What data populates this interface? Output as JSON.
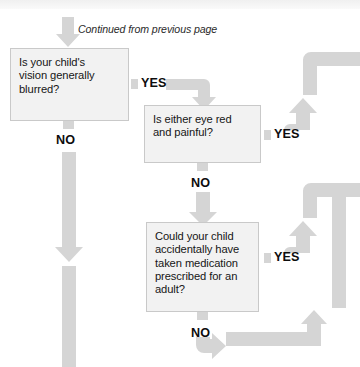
{
  "page": {
    "continued_note": "Continued from previous page",
    "background_color": "#ffffff",
    "arrow_color": "#d5d5d5",
    "box_fill": "#f2f2f2",
    "box_border": "#c9c9c9",
    "text_color": "#161616"
  },
  "nodes": [
    {
      "id": "q1",
      "name": "question-vision-blurred",
      "text": "Is your child's vision generally blurred?",
      "lines": [
        "Is your child's",
        "vision generally",
        "blurred?"
      ],
      "x": 10,
      "y": 48,
      "w": 119,
      "h": 73
    },
    {
      "id": "q2",
      "name": "question-eye-red-painful",
      "text": "Is either eye red and painful?",
      "lines": [
        "Is either eye red",
        "and painful?"
      ],
      "x": 144,
      "y": 105,
      "w": 117,
      "h": 58
    },
    {
      "id": "q3",
      "name": "question-adult-medication",
      "text": "Could your child accidentally have taken medication prescribed for an adult?",
      "lines": [
        "Could your child",
        "accidentally have",
        "taken medication",
        "prescribed for an",
        "adult?"
      ],
      "x": 146,
      "y": 222,
      "w": 113,
      "h": 90
    }
  ],
  "branch_labels": [
    {
      "id": "yes1",
      "name": "branch-label-yes-q1",
      "text": "YES",
      "x": 141,
      "y": 76
    },
    {
      "id": "no1",
      "name": "branch-label-no-q1",
      "text": "NO",
      "x": 56,
      "y": 133
    },
    {
      "id": "yes2",
      "name": "branch-label-yes-q2",
      "text": "YES",
      "x": 274,
      "y": 127
    },
    {
      "id": "no2",
      "name": "branch-label-no-q2",
      "text": "NO",
      "x": 191,
      "y": 176
    },
    {
      "id": "yes3",
      "name": "branch-label-yes-q3",
      "text": "YES",
      "x": 274,
      "y": 250
    },
    {
      "id": "no3",
      "name": "branch-label-no-q3",
      "text": "NO",
      "x": 191,
      "y": 326
    }
  ],
  "connectors": [
    {
      "id": "c-top-into-q1",
      "name": "arrow-down-into-q1",
      "direction": "down"
    },
    {
      "id": "c-q1-yes",
      "name": "arrow-yes-q1-to-q2",
      "direction": "right-down"
    },
    {
      "id": "c-q1-no",
      "name": "arrow-no-q1-down",
      "direction": "down"
    },
    {
      "id": "c-q1-no-tail",
      "name": "arrow-no-q1-continuation",
      "direction": "down"
    },
    {
      "id": "c-q2-yes",
      "name": "arrow-yes-q2-right-up",
      "direction": "right-up"
    },
    {
      "id": "c-q2-yes-exit",
      "name": "arrow-yes-q2-exit-right",
      "direction": "up-right"
    },
    {
      "id": "c-q2-no",
      "name": "arrow-no-q2-down-to-q3",
      "direction": "down"
    },
    {
      "id": "c-q3-yes",
      "name": "arrow-yes-q3-right-up",
      "direction": "right-up"
    },
    {
      "id": "c-q3-yes-exit",
      "name": "arrow-yes-q3-exit-right",
      "direction": "up-right"
    },
    {
      "id": "c-q3-no",
      "name": "arrow-no-q3-down-right-up",
      "direction": "down-right-up"
    }
  ]
}
